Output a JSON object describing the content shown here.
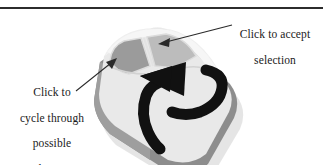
{
  "figure": {
    "background_color": "#ffffff",
    "rule_color": "#2c2c2c"
  },
  "callouts": [
    {
      "id": "accept",
      "name": "callout-accept-selection",
      "lines": [
        "Click to accept",
        "selection"
      ],
      "text": "Click to accept\nselection",
      "target": "right-mouse-button",
      "leader_from": [
        233,
        27
      ],
      "leader_to": [
        161,
        44
      ]
    },
    {
      "id": "cycle",
      "name": "callout-cycle-selections",
      "lines": [
        "Click to",
        "cycle through",
        "possible",
        "selections"
      ],
      "text": "Click to\ncycle through\npossible\nselections",
      "target": "left-mouse-button",
      "leader_from": [
        75,
        90
      ],
      "leader_to": [
        113,
        60
      ]
    }
  ],
  "illustration": {
    "name": "computer-mouse",
    "description": "Three-quarter view of a two-button computer mouse tilted diagonally, with a thick black curved arrow wrapping around the body",
    "colors": {
      "body_top": "#e8e8e8",
      "body_top_highlight": "#f2f2f2",
      "body_side_left": "#a8a8a8",
      "body_side_front": "#8f8f8f",
      "body_shadow": "#7d7d7d",
      "button_left": "#9a9a9a",
      "button_right": "#bdbdbd",
      "button_outline": "#d8d8d8",
      "arrow": "#111111",
      "leader_line": "#2a2a2a"
    },
    "parts": [
      {
        "name": "left-mouse-button",
        "label": "left button",
        "fill": "#9a9a9a"
      },
      {
        "name": "right-mouse-button",
        "label": "right button",
        "fill": "#bdbdbd"
      },
      {
        "name": "mouse-body",
        "label": "mouse body",
        "fill": "#e8e8e8"
      },
      {
        "name": "rotation-arrow",
        "label": "cycle rotation arrow",
        "fill": "#111111"
      }
    ]
  }
}
